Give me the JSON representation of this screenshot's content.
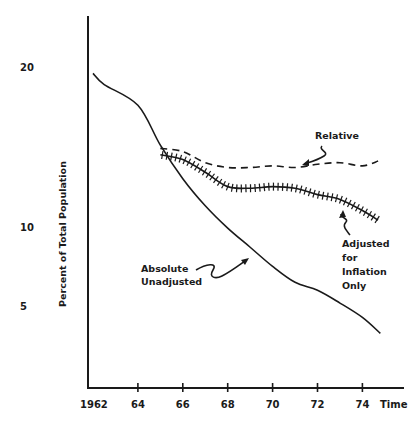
{
  "chart_data": {
    "type": "line",
    "title": "",
    "xlabel": "Time",
    "ylabel": "Percent of Total Population",
    "x_tick_labels": [
      "1962",
      "64",
      "66",
      "68",
      "70",
      "72",
      "74"
    ],
    "y_tick_labels": [
      "20",
      "10",
      "5"
    ],
    "y_tick_values": [
      20,
      10,
      5
    ],
    "xlim": [
      1962,
      1975
    ],
    "ylim": [
      0,
      22
    ],
    "grid": false,
    "legend": "inline annotations with arrows",
    "series": [
      {
        "name": "Absolute Unadjusted",
        "style": "solid",
        "x": [
          1962,
          1962.5,
          1964,
          1965,
          1966,
          1967,
          1968,
          1969,
          1970,
          1971,
          1972,
          1973,
          1974,
          1974.8
        ],
        "values": [
          19.6,
          18.9,
          17.6,
          15.1,
          13.0,
          11.3,
          9.9,
          8.7,
          7.5,
          6.5,
          6.0,
          5.2,
          4.3,
          3.3
        ]
      },
      {
        "name": "Relative",
        "style": "dashed",
        "x": [
          1965,
          1966,
          1967,
          1968,
          1969,
          1970,
          1971,
          1972,
          1973,
          1974,
          1974.7
        ],
        "values": [
          14.9,
          14.7,
          14.0,
          13.7,
          13.7,
          13.8,
          13.7,
          13.9,
          14.0,
          13.8,
          14.1
        ]
      },
      {
        "name": "Adjusted for Inflation Only",
        "style": "hatched",
        "x": [
          1965,
          1966,
          1967,
          1968,
          1969,
          1970,
          1971,
          1972,
          1973,
          1974,
          1974.7
        ],
        "values": [
          14.5,
          14.2,
          13.4,
          12.5,
          12.4,
          12.5,
          12.4,
          12.0,
          11.7,
          11.0,
          10.4
        ]
      }
    ],
    "annotations": [
      {
        "text": [
          "Relative"
        ],
        "target": "Relative"
      },
      {
        "text": [
          "Adjusted",
          "for",
          "Inflation",
          "Only"
        ],
        "target": "Adjusted for Inflation Only"
      },
      {
        "text": [
          "Absolute",
          "Unadjusted"
        ],
        "target": "Absolute Unadjusted"
      }
    ]
  },
  "labels": {
    "ylabel": "Percent of Total Population",
    "xlabel": "Time",
    "ann_relative": "Relative",
    "ann_adjusted_1": "Adjusted",
    "ann_adjusted_2": "for",
    "ann_adjusted_3": "Inflation",
    "ann_adjusted_4": "Only",
    "ann_absolute_1": "Absolute",
    "ann_absolute_2": "Unadjusted"
  }
}
